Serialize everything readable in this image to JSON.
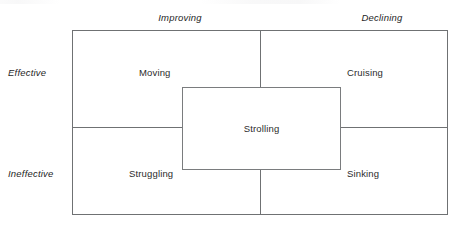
{
  "figure": {
    "width": 463,
    "height": 236,
    "background_color": "#ffffff",
    "line_color": "#6f7173",
    "text_color": "#2b2b2b"
  },
  "axes": {
    "columns": [
      {
        "key": "improving",
        "label": "Improving"
      },
      {
        "key": "declining",
        "label": "Declining"
      }
    ],
    "rows": [
      {
        "key": "effective",
        "label": "Effective"
      },
      {
        "key": "ineffective",
        "label": "Ineffective"
      }
    ]
  },
  "chart_data": {
    "type": "table",
    "title": "",
    "xlabel": "",
    "ylabel": "",
    "categories": [
      "Improving",
      "Declining"
    ],
    "row_categories": [
      "Effective",
      "Ineffective"
    ],
    "cells": [
      {
        "row": "Effective",
        "column": "Improving",
        "label": "Moving"
      },
      {
        "row": "Effective",
        "column": "Declining",
        "label": "Cruising"
      },
      {
        "row": "Ineffective",
        "column": "Improving",
        "label": "Struggling"
      },
      {
        "row": "Ineffective",
        "column": "Declining",
        "label": "Sinking"
      }
    ],
    "overlap": {
      "label": "Strolling",
      "spans_rows": [
        "Effective",
        "Ineffective"
      ],
      "spans_columns": [
        "Improving",
        "Declining"
      ]
    },
    "grid": true,
    "legend": "none"
  },
  "quadrants": {
    "moving": "Moving",
    "cruising": "Cruising",
    "struggling": "Struggling",
    "sinking": "Sinking"
  },
  "center": {
    "label": "Strolling"
  }
}
